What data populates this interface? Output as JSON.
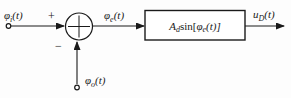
{
  "figure": {
    "labels": {
      "input": {
        "base": "φ",
        "sub": "i",
        "rest": "(t)"
      },
      "error": {
        "base": "φ",
        "sub": "e",
        "rest": "(t)"
      },
      "output": {
        "base": "u",
        "sub": "D",
        "rest": "(t)"
      },
      "feedback": {
        "base": "φ",
        "sub": "o",
        "rest": "(t)"
      },
      "block": {
        "base": "A",
        "sub": "d",
        "fn": "sin[",
        "arg": "φ",
        "argsub": "e",
        "rest": "(t)]"
      },
      "plus_sign": "+",
      "minus_sign": "−"
    },
    "colors": {
      "line": "#1a1a1a",
      "background": "#fdfdfd",
      "block_fill": "#ffffff"
    }
  }
}
